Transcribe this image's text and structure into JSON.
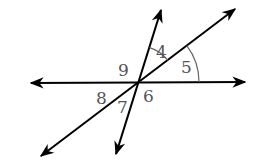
{
  "diagram": {
    "title": "",
    "colors": {
      "line": "#000000",
      "arc": "#666666",
      "label": "#555555",
      "background": "#ffffff"
    },
    "intersection": {
      "x": 139,
      "y": 82
    },
    "lines": [
      {
        "id": "horizontal",
        "x1": 31,
        "y1": 83,
        "x2": 245,
        "y2": 82,
        "arrows": "both"
      },
      {
        "id": "steep",
        "x1": 116,
        "y1": 154,
        "x2": 161,
        "y2": 10,
        "arrows": "both"
      },
      {
        "id": "diagonal",
        "x1": 41,
        "y1": 156,
        "x2": 235,
        "y2": 9,
        "arrows": "both"
      }
    ],
    "angles": [
      {
        "label": "4",
        "x": 156,
        "y": 58
      },
      {
        "label": "5",
        "x": 181,
        "y": 73
      },
      {
        "label": "6",
        "x": 143,
        "y": 102
      },
      {
        "label": "7",
        "x": 117,
        "y": 113
      },
      {
        "label": "8",
        "x": 96,
        "y": 104
      },
      {
        "label": "9",
        "x": 118,
        "y": 76
      }
    ],
    "arcs": [
      {
        "for": "4",
        "radius": 36
      },
      {
        "for": "5",
        "radius": 60
      }
    ]
  }
}
